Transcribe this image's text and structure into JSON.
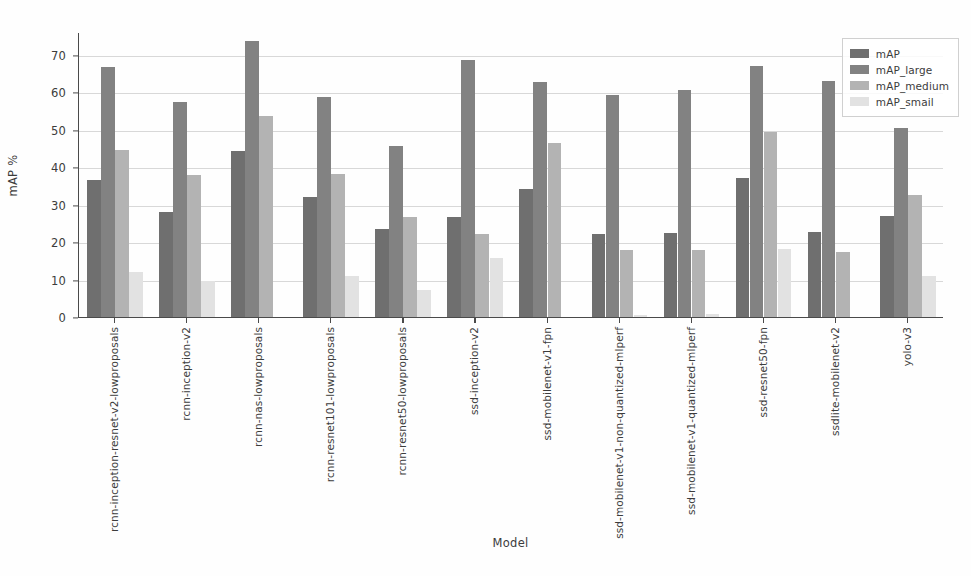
{
  "chart_data": {
    "type": "bar",
    "title": "",
    "xlabel": "Model",
    "ylabel": "mAP %",
    "ylim": [
      0,
      76
    ],
    "yticks": [
      0,
      10,
      20,
      30,
      40,
      50,
      60,
      70
    ],
    "grid": true,
    "legend_position": "upper right",
    "categories": [
      "rcnn-inception-resnet-v2-lowproposals",
      "rcnn-inception-v2",
      "rcnn-nas-lowproposals",
      "rcnn-resnet101-lowproposals",
      "rcnn-resnet50-lowproposals",
      "ssd-inception-v2",
      "ssd-mobilenet-v1-fpn",
      "ssd-mobilenet-v1-non-quantized-mlperf",
      "ssd-mobilenet-v1-quantized-mlperf",
      "ssd-resnet50-fpn",
      "ssdlite-mobilenet-v2",
      "yolo-v3"
    ],
    "series": [
      {
        "name": "mAP",
        "color": "#6f6f6f",
        "values": [
          36.5,
          28.0,
          44.3,
          32.0,
          23.5,
          26.7,
          34.2,
          22.2,
          22.4,
          37.2,
          22.8,
          27.0
        ]
      },
      {
        "name": "mAP_large",
        "color": "#828282",
        "values": [
          66.8,
          57.4,
          73.5,
          58.8,
          45.5,
          68.5,
          62.6,
          59.3,
          60.5,
          67.0,
          63.0,
          50.5
        ]
      },
      {
        "name": "mAP_medium",
        "color": "#b3b3b3",
        "values": [
          44.6,
          38.0,
          53.6,
          38.1,
          26.6,
          22.2,
          46.4,
          17.8,
          17.8,
          49.4,
          17.4,
          32.5
        ]
      },
      {
        "name": "mAP_small",
        "color": "#e2e2e2",
        "values": [
          12.0,
          9.6,
          0.0,
          11.0,
          7.2,
          15.8,
          0.0,
          0.6,
          0.9,
          18.2,
          0.0,
          11.0
        ]
      }
    ]
  },
  "legend": {
    "entries": [
      {
        "label": "mAP",
        "key": "mAP"
      },
      {
        "label": "mAP_large",
        "key": "mAP_large"
      },
      {
        "label": "mAP_medium",
        "key": "mAP_medium"
      },
      {
        "label": "mAP_smail",
        "key": "mAP_small"
      }
    ]
  },
  "colors": {
    "map": "#6f6f6f",
    "map_large": "#828282",
    "map_medium": "#b3b3b3",
    "map_small": "#e2e2e2",
    "axis": "#4a4a4a",
    "grid": "#d8d8d8",
    "background": "#fefefe"
  }
}
